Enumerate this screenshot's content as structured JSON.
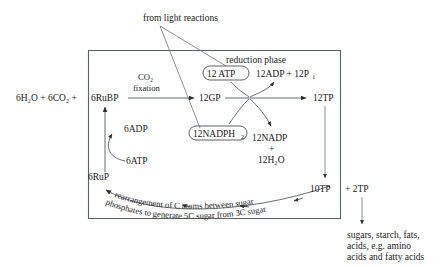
{
  "diagram": {
    "title_note": "from light reactions",
    "reduction_phase_label": "reduction phase",
    "inputs_left": "6H₂O + 6CO₂ +",
    "nodes": {
      "rubp": "6RuBP",
      "co2_fixation_line1": "CO₂",
      "co2_fixation_line2": "fixation",
      "gp": "12GP",
      "tp": "12TP",
      "atp": "12 ATP",
      "adp_pi": "12ADP + 12P",
      "adp_pi_sub": "i",
      "nadph": "12NADPH",
      "nadph_sub": "2",
      "nadp": "12NADP",
      "plus": "+",
      "water": "12H₂O",
      "adp6": "6ADP",
      "atp6": "6ATP",
      "rup": "6RuP",
      "tp10": "10TP",
      "tp2": "+ 2TP"
    },
    "curved_caption_line1": "rearrangement of C atoms between sugar",
    "curved_caption_line2": "phosphates to generate 5C sugar from 3C sugar",
    "products": {
      "line1": "sugars, starch, fats,",
      "line2": "acids, e.g. amino",
      "line3": "acids and fatty acids"
    },
    "colors": {
      "ink": "#1a1a1a",
      "line": "#555c62",
      "background": "#ffffff"
    }
  }
}
